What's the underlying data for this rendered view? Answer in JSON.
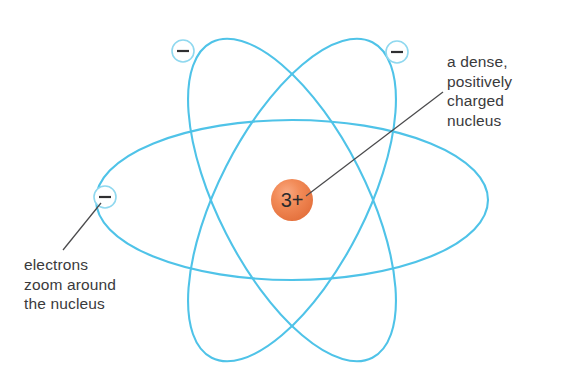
{
  "figure": {
    "background_color": "#ffffff"
  },
  "nucleus": {
    "charge_label": "3+",
    "fill_color": "#ef7f4f",
    "center_x": 292,
    "center_y": 200,
    "radius": 21
  },
  "orbits": {
    "stroke_color": "#4fc3e8",
    "count": 3,
    "center_x": 292,
    "center_y": 200,
    "items": [
      {
        "name": "orbit-horizontal",
        "rx": 196,
        "ry": 80,
        "rotation_deg": 0
      },
      {
        "name": "orbit-tilted-left",
        "rx": 74,
        "ry": 177,
        "rotation_deg": -27
      },
      {
        "name": "orbit-tilted-right",
        "rx": 74,
        "ry": 177,
        "rotation_deg": 27
      }
    ]
  },
  "electrons": {
    "charge_sign": "minus-sign",
    "outline_color": "#8fd8ef",
    "fill_color": "#ffffff",
    "radius": 11,
    "items": [
      {
        "name": "electron-top-left",
        "cx": 183,
        "cy": 51
      },
      {
        "name": "electron-top-right",
        "cx": 397,
        "cy": 52
      },
      {
        "name": "electron-left",
        "cx": 105,
        "cy": 197
      }
    ]
  },
  "annotations": {
    "nucleus_label": {
      "lines": [
        "a dense,",
        "positively",
        "charged",
        "nucleus"
      ],
      "pointer_from_x": 443,
      "pointer_from_y": 92,
      "pointer_to_x": 306,
      "pointer_to_y": 196
    },
    "electrons_label": {
      "lines": [
        "electrons",
        "zoom around",
        "the nucleus"
      ],
      "pointer_from_x": 63,
      "pointer_from_y": 250,
      "pointer_to_x": 101,
      "pointer_to_y": 203
    }
  }
}
